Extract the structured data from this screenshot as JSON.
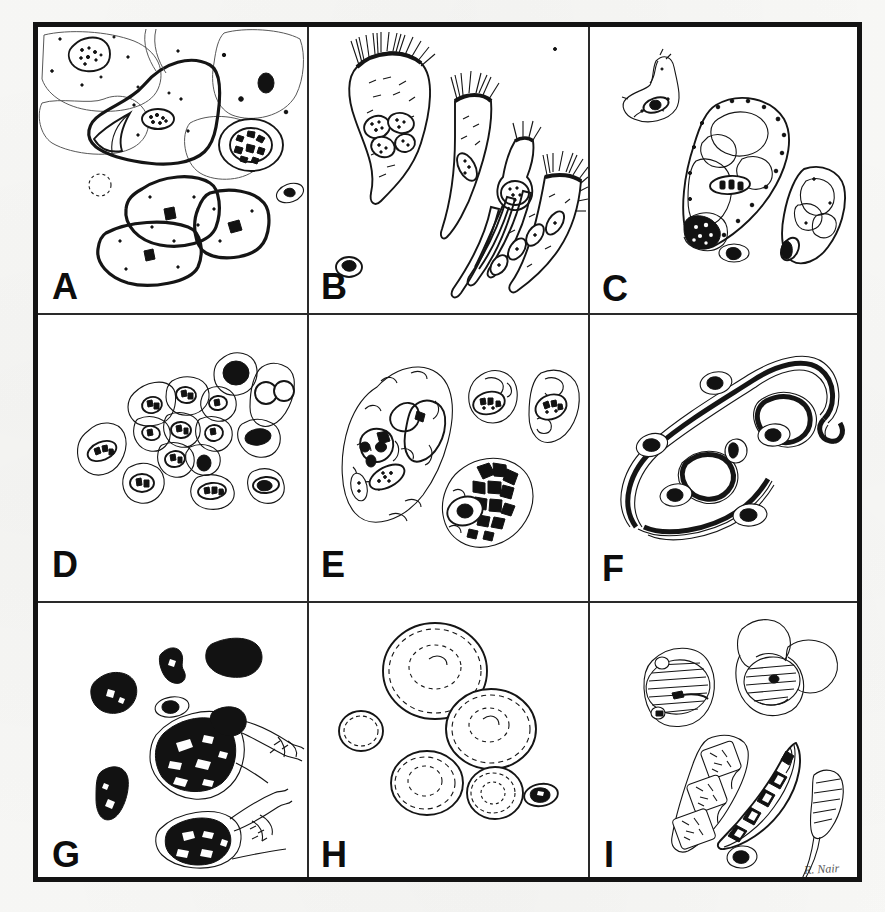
{
  "figure": {
    "kind": "scientific-plate",
    "medium": "hand-drawn ink illustration, scanned",
    "grid": {
      "rows": 3,
      "cols": 3
    },
    "signature": "R. Nair",
    "background_color": "#fbfbf9",
    "ink_color": "#151515",
    "border_color": "#131313"
  },
  "panels": [
    {
      "letter": "A",
      "row": 0,
      "col": 0,
      "subject": "Squamous epithelial cells",
      "description": "Large flat polygonal squamous cells with small central nuclei, overlapping sheets, plus a few small round cells and scattered debris granules."
    },
    {
      "letter": "B",
      "row": 0,
      "col": 1,
      "subject": "Ciliated columnar epithelial cells",
      "description": "Tapering columnar cells bearing terminal bars and tufts of cilia, single cells and a cohesive strip of four cells with oval nuclei."
    },
    {
      "letter": "C",
      "row": 0,
      "col": 2,
      "subject": "Goblet and vacuolated secretory cells",
      "description": "Cells distended by mucus vacuoles with compressed basal nuclei and coarse granular cytoplasm."
    },
    {
      "letter": "D",
      "row": 1,
      "col": 0,
      "subject": "Basal and reserve cells",
      "description": "Cluster of small uniform polygonal cells with scant cytoplasm and round hyperchromatic nuclei, with scattered single cells around the group."
    },
    {
      "letter": "E",
      "row": 1,
      "col": 1,
      "subject": "Alveolar macrophages",
      "description": "Large oval macrophages with abundant vacuolated cytoplasm containing ingested particles and dense dark phagocytosed material."
    },
    {
      "letter": "F",
      "row": 1,
      "col": 2,
      "subject": "Curschmann spirals and mucus strands",
      "description": "Thick dark-cored mucus strands with a pale sheath forming loops and coils, with small free cells alongside."
    },
    {
      "letter": "G",
      "row": 2,
      "col": 0,
      "subject": "Carbon-laden (anthracotic) macrophages",
      "description": "Cells and free aggregates densely packed with opaque black carbon pigment, some with trailing cytoplasmic tails."
    },
    {
      "letter": "H",
      "row": 2,
      "col": 1,
      "subject": "Yeast and spore forms",
      "description": "Rounded, thick double-contoured refractile bodies of varying size resembling yeast cells and spores, plus one small nucleated cell."
    },
    {
      "letter": "I",
      "row": 2,
      "col": 2,
      "subject": "Pollen grains and fungal spores",
      "description": "Striated pollen grains with air sacs, a segmented multicellular spore chain, a curved septate macroconidium and a tapering spore."
    }
  ]
}
